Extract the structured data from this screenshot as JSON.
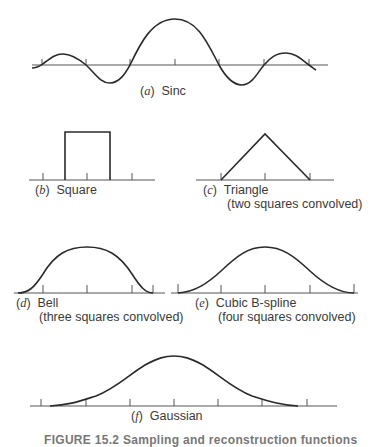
{
  "panels": [
    {
      "id": "a",
      "letter": "a",
      "title": "Sinc",
      "subtitle": ""
    },
    {
      "id": "b",
      "letter": "b",
      "title": "Square",
      "subtitle": ""
    },
    {
      "id": "c",
      "letter": "c",
      "title": "Triangle",
      "subtitle": "(two squares convolved)"
    },
    {
      "id": "d",
      "letter": "d",
      "title": "Bell",
      "subtitle": "(three squares convolved)"
    },
    {
      "id": "e",
      "letter": "e",
      "title": "Cubic B-spline",
      "subtitle": "(four squares convolved)"
    },
    {
      "id": "f",
      "letter": "f",
      "title": "Gaussian",
      "subtitle": ""
    }
  ],
  "caption": "FIGURE 15.2  Sampling and reconstruction functions",
  "colors": {
    "stroke": "#2a2a2a",
    "axis": "#555555"
  }
}
